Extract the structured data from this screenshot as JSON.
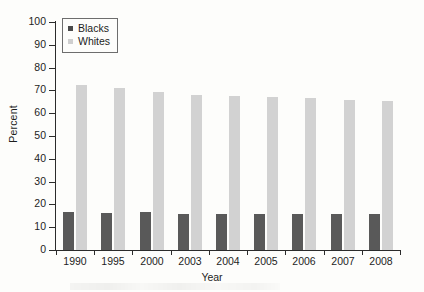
{
  "chart_data": {
    "type": "bar",
    "title": "",
    "subtitle": "",
    "xlabel": "Year",
    "ylabel": "Percent",
    "categories": [
      "1990",
      "1995",
      "2000",
      "2003",
      "2004",
      "2005",
      "2006",
      "2007",
      "2008"
    ],
    "series": [
      {
        "name": "Blacks",
        "color": "#595959",
        "values": [
          16.5,
          16.3,
          16.5,
          16.0,
          16.0,
          15.9,
          15.8,
          15.8,
          15.7
        ]
      },
      {
        "name": "Whites",
        "color": "#d2d2d2",
        "values": [
          72.5,
          71.0,
          69.5,
          68.0,
          67.5,
          67.0,
          66.5,
          66.0,
          65.5
        ]
      }
    ],
    "ylim": [
      0,
      100
    ],
    "ytick_values": [
      0,
      10,
      20,
      30,
      40,
      50,
      60,
      70,
      80,
      90,
      100
    ],
    "ytick_labels": [
      "0",
      "10",
      "20",
      "30",
      "40",
      "50",
      "60",
      "70",
      "80",
      "90",
      "100"
    ],
    "grid": false,
    "legend_position": "upper left",
    "legend_entries": [
      "Blacks",
      "Whites"
    ]
  },
  "axes": {
    "y_title": "Percent",
    "x_title": "Year"
  },
  "legend": {
    "items": [
      {
        "label": "Blacks",
        "swatch": "legend-swatch-blacks"
      },
      {
        "label": "Whites",
        "swatch": "legend-swatch-whites"
      }
    ]
  }
}
